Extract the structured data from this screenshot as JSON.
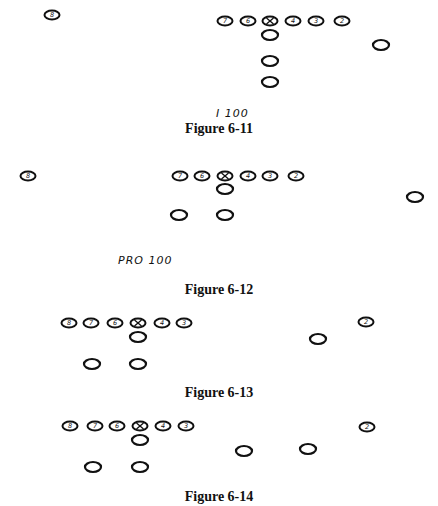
{
  "colors": {
    "ink": "#111111",
    "background": "#ffffff"
  },
  "figures": [
    {
      "caption": "Figure 6-11",
      "formation_label": "I 100",
      "players": [
        {
          "id": "8",
          "x": 52,
          "y": 15,
          "label": "8"
        },
        {
          "id": "7",
          "x": 225,
          "y": 21,
          "label": "7"
        },
        {
          "id": "6",
          "x": 248,
          "y": 21,
          "label": "6"
        },
        {
          "id": "center",
          "x": 270,
          "y": 21,
          "label": "X"
        },
        {
          "id": "4",
          "x": 293,
          "y": 21,
          "label": "4"
        },
        {
          "id": "3",
          "x": 316,
          "y": 21,
          "label": "3"
        },
        {
          "id": "2",
          "x": 342,
          "y": 21,
          "label": "2"
        },
        {
          "id": "qb",
          "x": 270,
          "y": 35,
          "label": ""
        },
        {
          "id": "flanker",
          "x": 381,
          "y": 45,
          "label": ""
        },
        {
          "id": "fullback",
          "x": 270,
          "y": 61,
          "label": ""
        },
        {
          "id": "tailback",
          "x": 270,
          "y": 82,
          "label": ""
        }
      ]
    },
    {
      "caption": "Figure 6-12",
      "formation_label": "PRO 100",
      "players": [
        {
          "id": "8",
          "x": 28,
          "y": 176,
          "label": "8"
        },
        {
          "id": "7",
          "x": 180,
          "y": 176,
          "label": "7"
        },
        {
          "id": "6",
          "x": 202,
          "y": 176,
          "label": "6"
        },
        {
          "id": "center",
          "x": 225,
          "y": 176,
          "label": "X"
        },
        {
          "id": "4",
          "x": 248,
          "y": 176,
          "label": "4"
        },
        {
          "id": "3",
          "x": 270,
          "y": 176,
          "label": "3"
        },
        {
          "id": "2",
          "x": 296,
          "y": 176,
          "label": "2"
        },
        {
          "id": "qb",
          "x": 225,
          "y": 189,
          "label": ""
        },
        {
          "id": "flanker",
          "x": 415,
          "y": 197,
          "label": ""
        },
        {
          "id": "halfback-left",
          "x": 179,
          "y": 215,
          "label": ""
        },
        {
          "id": "halfback-right",
          "x": 225,
          "y": 215,
          "label": ""
        }
      ]
    },
    {
      "caption": "Figure 6-13",
      "formation_label": "",
      "players": [
        {
          "id": "8",
          "x": 69,
          "y": 323,
          "label": "8"
        },
        {
          "id": "7",
          "x": 91,
          "y": 323,
          "label": "7"
        },
        {
          "id": "6",
          "x": 115,
          "y": 323,
          "label": "6"
        },
        {
          "id": "center",
          "x": 138,
          "y": 323,
          "label": "X"
        },
        {
          "id": "4",
          "x": 162,
          "y": 323,
          "label": "4"
        },
        {
          "id": "3",
          "x": 184,
          "y": 323,
          "label": "3"
        },
        {
          "id": "2",
          "x": 366,
          "y": 322,
          "label": "2"
        },
        {
          "id": "qb",
          "x": 138,
          "y": 337,
          "label": ""
        },
        {
          "id": "wing",
          "x": 318,
          "y": 339,
          "label": ""
        },
        {
          "id": "halfback-left",
          "x": 92,
          "y": 364,
          "label": ""
        },
        {
          "id": "halfback-right",
          "x": 138,
          "y": 364,
          "label": ""
        }
      ]
    },
    {
      "caption": "Figure 6-14",
      "formation_label": "",
      "players": [
        {
          "id": "8",
          "x": 70,
          "y": 426,
          "label": "8"
        },
        {
          "id": "7",
          "x": 95,
          "y": 426,
          "label": "7"
        },
        {
          "id": "6",
          "x": 117,
          "y": 426,
          "label": "6"
        },
        {
          "id": "center",
          "x": 140,
          "y": 426,
          "label": "X"
        },
        {
          "id": "4",
          "x": 163,
          "y": 426,
          "label": "4"
        },
        {
          "id": "3",
          "x": 186,
          "y": 426,
          "label": "3"
        },
        {
          "id": "2",
          "x": 367,
          "y": 427,
          "label": "2"
        },
        {
          "id": "qb",
          "x": 140,
          "y": 440,
          "label": ""
        },
        {
          "id": "slot",
          "x": 244,
          "y": 451,
          "label": ""
        },
        {
          "id": "wing",
          "x": 308,
          "y": 449,
          "label": ""
        },
        {
          "id": "halfback-left",
          "x": 93,
          "y": 467,
          "label": ""
        },
        {
          "id": "halfback-right",
          "x": 140,
          "y": 467,
          "label": ""
        }
      ]
    }
  ],
  "layout": {
    "captions_y": [
      122,
      283,
      386,
      490
    ],
    "labels": [
      {
        "text_path": "figures.0.formation_label",
        "x": 218,
        "y": 108
      },
      {
        "text_path": "figures.1.formation_label",
        "x": 118,
        "y": 255
      }
    ]
  }
}
